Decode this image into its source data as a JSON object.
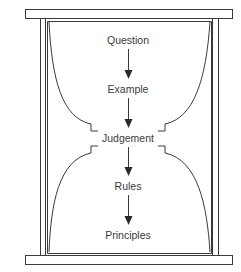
{
  "diagram": {
    "type": "hourglass-flow",
    "stroke_color": "#3a3a3a",
    "background_color": "#ffffff",
    "nodes": [
      {
        "id": "question",
        "label": "Question"
      },
      {
        "id": "example",
        "label": "Example"
      },
      {
        "id": "judgement",
        "label": "Judgement"
      },
      {
        "id": "rules",
        "label": "Rules"
      },
      {
        "id": "principles",
        "label": "Principles"
      }
    ],
    "edges": [
      {
        "from": "question",
        "to": "example"
      },
      {
        "from": "example",
        "to": "judgement"
      },
      {
        "from": "judgement",
        "to": "rules"
      },
      {
        "from": "rules",
        "to": "principles"
      }
    ]
  }
}
